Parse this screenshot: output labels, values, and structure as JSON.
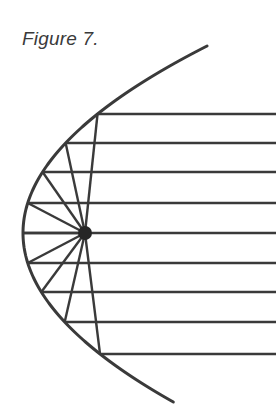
{
  "figure": {
    "caption": "Figure 7.",
    "background_color": "#ffffff",
    "stroke_color": "#3a3a3a",
    "focus_dot_color": "#262626",
    "canvas": {
      "width": 276,
      "height": 413
    }
  },
  "chart_data": {
    "type": "line",
    "title": "Figure 7.",
    "subtitle": "",
    "xlabel": "",
    "ylabel": "",
    "grid": false,
    "legend": null,
    "axis_ranges": {
      "xlim": [
        0,
        276
      ],
      "ylim": [
        0,
        413
      ]
    },
    "annotations": [
      {
        "name": "caption",
        "text": "Figure 7.",
        "x": 22,
        "y": 42
      }
    ],
    "geometry": {
      "coordinate_note": "pixel coordinates, origin top-left of the 276x413 image",
      "parabola": {
        "vertex": {
          "x": 23,
          "y": 233
        },
        "opens": "right",
        "four_p": 190,
        "equation": "x = 23 + (y - 233)^2 / 190",
        "y_start": 46,
        "y_end": 402,
        "stroke_width": 3
      },
      "focus": {
        "x": 85,
        "y": 233,
        "radius": 7,
        "label": "focus"
      },
      "rays": [
        {
          "index": 1,
          "incoming_y": 114,
          "hit_x": 102,
          "hit_y": 114,
          "ray_start_x": 276
        },
        {
          "index": 2,
          "incoming_y": 143,
          "hit_x": 69,
          "hit_y": 143,
          "ray_start_x": 276
        },
        {
          "index": 3,
          "incoming_y": 172,
          "hit_x": 43,
          "hit_y": 172,
          "ray_start_x": 276
        },
        {
          "index": 4,
          "incoming_y": 203,
          "hit_x": 28,
          "hit_y": 203,
          "ray_start_x": 276
        },
        {
          "index": 5,
          "incoming_y": 233,
          "hit_x": 23,
          "hit_y": 233,
          "ray_start_x": 276
        },
        {
          "index": 6,
          "incoming_y": 263,
          "hit_x": 28,
          "hit_y": 263,
          "ray_start_x": 276
        },
        {
          "index": 7,
          "incoming_y": 292,
          "hit_x": 43,
          "hit_y": 292,
          "ray_start_x": 276
        },
        {
          "index": 8,
          "incoming_y": 322,
          "hit_x": 69,
          "hit_y": 322,
          "ray_start_x": 276
        },
        {
          "index": 9,
          "incoming_y": 354,
          "hit_x": 102,
          "hit_y": 354,
          "ray_start_x": 276
        }
      ],
      "ray_count": 9,
      "ray_spacing_px": 30,
      "stroke_width_rays": 2.4
    }
  }
}
